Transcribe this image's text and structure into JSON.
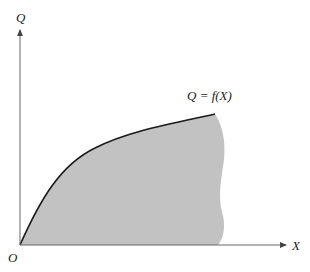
{
  "diagram": {
    "y_axis_label": "Q",
    "x_axis_label": "X",
    "origin_label": "O",
    "curve_label": "Q = f(X)",
    "colors": {
      "fill": "#c2c2c2",
      "curve": "#1a1a1a",
      "axis": "#555555"
    }
  }
}
